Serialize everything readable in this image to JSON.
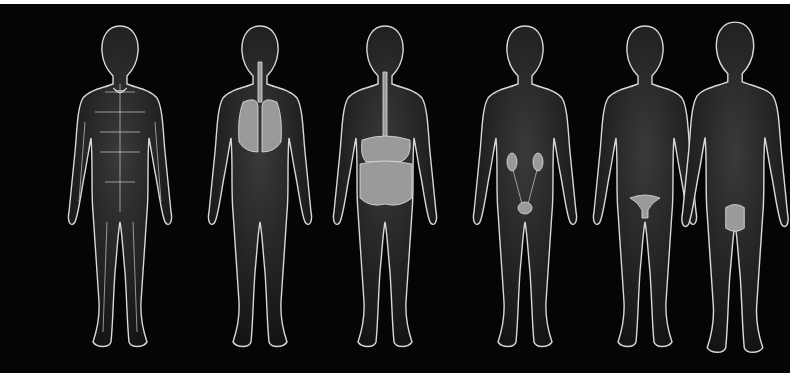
{
  "figure": {
    "background_color": "#050505",
    "outline_color": "#d8d8d8",
    "figures": [
      {
        "id": "lymphatic",
        "label": "Lymphatic system",
        "x": 65
      },
      {
        "id": "respiratory",
        "label": "Respiratory system",
        "x": 205
      },
      {
        "id": "digestive",
        "label": "Digestive system",
        "x": 330
      },
      {
        "id": "urinary",
        "label": "Urinary system",
        "x": 470
      },
      {
        "id": "reproductive-female",
        "label": "Female reproductive system",
        "x": 590
      },
      {
        "id": "reproductive-male",
        "label": "Male reproductive system",
        "x": 675
      }
    ]
  }
}
